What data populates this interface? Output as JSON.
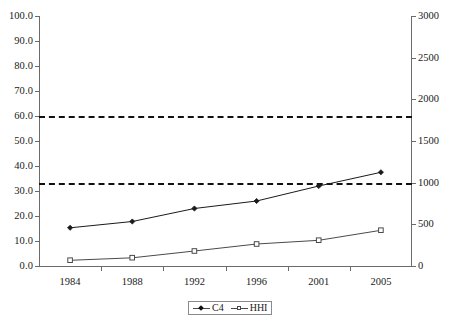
{
  "chart_data": {
    "type": "line",
    "title": "",
    "xlabel": "",
    "ylabel": "",
    "categories": [
      "1984",
      "1988",
      "1992",
      "1996",
      "2001",
      "2005"
    ],
    "series": [
      {
        "name": "C4",
        "axis": "left",
        "marker": "filled-diamond",
        "values": [
          15.3,
          17.8,
          23.0,
          26.0,
          32.0,
          37.5
        ]
      },
      {
        "name": "HHI",
        "axis": "right",
        "marker": "open-square",
        "values_right_axis": [
          70,
          100,
          180,
          265,
          310,
          430
        ],
        "values": [
          2.3,
          3.3,
          6.0,
          8.8,
          10.3,
          14.3
        ]
      }
    ],
    "left_axis": {
      "ticks": [
        "0.0",
        "10.0",
        "20.0",
        "30.0",
        "40.0",
        "50.0",
        "60.0",
        "70.0",
        "80.0",
        "90.0",
        "100.0"
      ],
      "ylim": [
        0,
        100
      ]
    },
    "right_axis": {
      "ticks": [
        "0",
        "500",
        "1000",
        "1500",
        "2000",
        "2500",
        "3000"
      ],
      "ylim": [
        0,
        3000
      ]
    },
    "annotations": [
      {
        "name": "hhi-threshold-1800",
        "axis": "right",
        "value": 1800,
        "left_axis_value": 60.6,
        "style": "dashed"
      },
      {
        "name": "hhi-threshold-1000",
        "axis": "right",
        "value": 1000,
        "left_axis_value": 33.3,
        "style": "dashed"
      }
    ],
    "legend": {
      "position": "bottom-center",
      "entries": [
        {
          "label": "C4",
          "marker": "filled-diamond"
        },
        {
          "label": "HHI",
          "marker": "open-square"
        }
      ]
    },
    "grid": false,
    "colors": {
      "axis": "#6b6b6b",
      "series_c4": "#1a1a1a",
      "series_hhi": "#4a4a4a",
      "threshold": "#111111",
      "background": "#ffffff"
    }
  }
}
